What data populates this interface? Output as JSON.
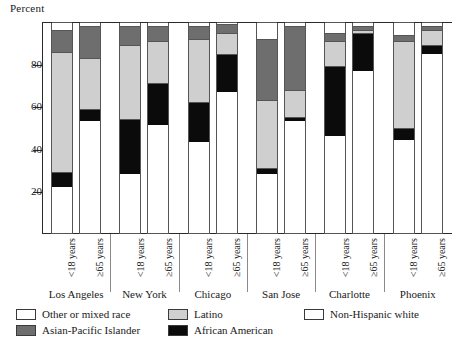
{
  "chart_data": {
    "type": "bar",
    "subtype": "stacked-bar-100",
    "title": "",
    "ylabel": "Percent",
    "xlabel": "",
    "ylim": [
      0,
      100
    ],
    "yticks": [
      20,
      40,
      60,
      80
    ],
    "ytick_labels": [
      "20",
      "40",
      "60",
      "80"
    ],
    "grid": false,
    "legend_position": "bottom",
    "categories": [
      "Los Angeles",
      "New York",
      "Chicago",
      "San Jose",
      "Charlotte",
      "Phoenix"
    ],
    "subcategories": [
      "<18 years",
      "≥65 years"
    ],
    "legend": [
      "Other or mixed race",
      "Latino",
      "Non-Hispanic white",
      "Asian-Pacific Islander",
      "African American"
    ],
    "series": [
      {
        "name": "Non-Hispanic white",
        "color": "#ffffff"
      },
      {
        "name": "African American",
        "color": "#0b0b0b"
      },
      {
        "name": "Latino",
        "color": "#cfcfcf"
      },
      {
        "name": "Asian-Pacific Islander",
        "color": "#6e6e6e"
      },
      {
        "name": "Other or mixed race",
        "color": "#ffffff"
      }
    ],
    "bars": [
      {
        "city": "Los Angeles",
        "age": "<18 years",
        "non_hispanic_white": 22,
        "african_american": 7,
        "latino": 57,
        "asian_pacific_islander": 10,
        "other_or_mixed_race": 4
      },
      {
        "city": "Los Angeles",
        "age": "≥65 years",
        "non_hispanic_white": 53,
        "african_american": 6,
        "latino": 24,
        "asian_pacific_islander": 15,
        "other_or_mixed_race": 2
      },
      {
        "city": "New York",
        "age": "<18 years",
        "non_hispanic_white": 28,
        "african_american": 26,
        "latino": 35,
        "asian_pacific_islander": 9,
        "other_or_mixed_race": 2
      },
      {
        "city": "New York",
        "age": "≥65 years",
        "non_hispanic_white": 51,
        "african_american": 20,
        "latino": 20,
        "asian_pacific_islander": 7,
        "other_or_mixed_race": 2
      },
      {
        "city": "Chicago",
        "age": "<18 years",
        "non_hispanic_white": 43,
        "african_american": 19,
        "latino": 30,
        "asian_pacific_islander": 6,
        "other_or_mixed_race": 2
      },
      {
        "city": "Chicago",
        "age": "≥65 years",
        "non_hispanic_white": 67,
        "african_american": 18,
        "latino": 10,
        "asian_pacific_islander": 4,
        "other_or_mixed_race": 1
      },
      {
        "city": "San Jose",
        "age": "<18 years",
        "non_hispanic_white": 28,
        "african_american": 3,
        "latino": 32,
        "asian_pacific_islander": 29,
        "other_or_mixed_race": 8
      },
      {
        "city": "San Jose",
        "age": "≥65 years",
        "non_hispanic_white": 53,
        "african_american": 2,
        "latino": 13,
        "asian_pacific_islander": 30,
        "other_or_mixed_race": 2
      },
      {
        "city": "Charlotte",
        "age": "<18 years",
        "non_hispanic_white": 46,
        "african_american": 33,
        "latino": 12,
        "asian_pacific_islander": 4,
        "other_or_mixed_race": 5
      },
      {
        "city": "Charlotte",
        "age": "≥65 years",
        "non_hispanic_white": 77,
        "african_american": 18,
        "latino": 1,
        "asian_pacific_islander": 2,
        "other_or_mixed_race": 2
      },
      {
        "city": "Phoenix",
        "age": "<18 years",
        "non_hispanic_white": 44,
        "african_american": 6,
        "latino": 41,
        "asian_pacific_islander": 3,
        "other_or_mixed_race": 6
      },
      {
        "city": "Phoenix",
        "age": "≥65 years",
        "non_hispanic_white": 85,
        "african_american": 4,
        "latino": 7,
        "asian_pacific_islander": 2,
        "other_or_mixed_race": 2
      }
    ]
  }
}
